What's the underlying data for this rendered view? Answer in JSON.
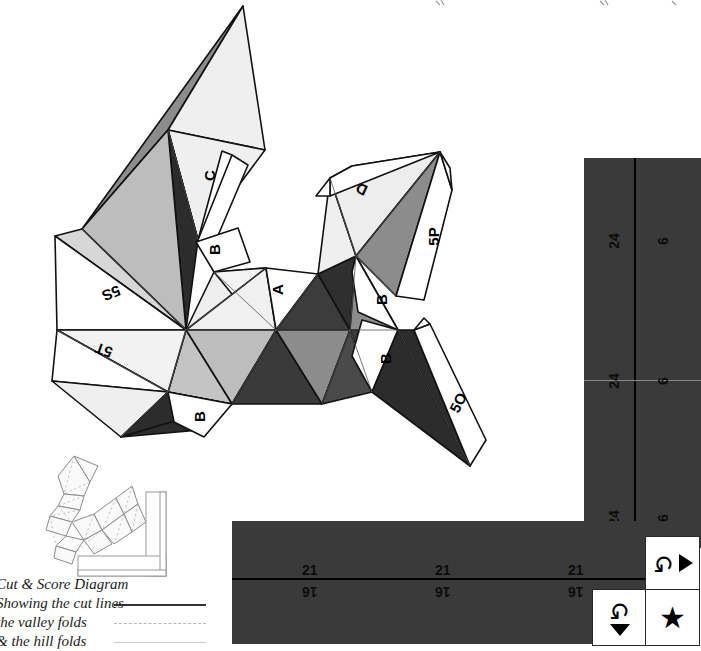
{
  "document": {
    "type": "papercraft-cut-and-score-diagram",
    "title_cut_off_at_top": true
  },
  "legend": {
    "lines": [
      {
        "text": "Cut & Score Diagram",
        "sample": "none"
      },
      {
        "text": "Showing the cut lines",
        "sample": "solid-dark"
      },
      {
        "text": "the valley folds",
        "sample": "dashed-light"
      },
      {
        "text": "& the hill folds",
        "sample": "solid-light"
      }
    ]
  },
  "net_labels": [
    {
      "id": "label-C",
      "text": "C",
      "x": 204,
      "y": 167,
      "rot": -90
    },
    {
      "id": "label-B1",
      "text": "B",
      "x": 209,
      "y": 241,
      "rot": -90
    },
    {
      "id": "label-A",
      "text": "A",
      "x": 272,
      "y": 281,
      "rot": -90
    },
    {
      "id": "label-5S",
      "text": "5S",
      "x": 108,
      "y": 291,
      "rot": 158
    },
    {
      "id": "label-5T",
      "text": "5T",
      "x": 99,
      "y": 348,
      "rot": 200
    },
    {
      "id": "label-B2",
      "text": "B",
      "x": 194,
      "y": 408,
      "rot": -90
    },
    {
      "id": "label-D",
      "text": "D",
      "x": 356,
      "y": 181,
      "rot": 205
    },
    {
      "id": "label-5P",
      "text": "5P",
      "x": 429,
      "y": 232,
      "rot": -90
    },
    {
      "id": "label-B3",
      "text": "B",
      "x": 376,
      "y": 291,
      "rot": -90
    },
    {
      "id": "label-B4",
      "text": "B",
      "x": 380,
      "y": 350,
      "rot": -90
    },
    {
      "id": "label-5O",
      "text": "5O",
      "x": 452,
      "y": 399,
      "rot": -60
    }
  ],
  "panels": {
    "color": "#3a3a3a",
    "vertical": {
      "name": "vertical-strip-panel",
      "segments": [
        {
          "long_label": "24",
          "short_label": "6"
        },
        {
          "long_label": "24",
          "short_label": "6"
        },
        {
          "long_label": "24",
          "short_label": "6"
        }
      ]
    },
    "horizontal": {
      "name": "horizontal-strip-panel",
      "top_row_labels": [
        "21",
        "21",
        "21"
      ],
      "bottom_row_labels": [
        "16",
        "16",
        "16"
      ]
    }
  },
  "symbol_squares": [
    {
      "id": "square-rotate-right",
      "glyphs": [
        "rotate-ccw-icon",
        "triangle-right-icon"
      ],
      "layout": "row"
    },
    {
      "id": "square-rotate-down",
      "glyphs": [
        "rotate-ccw-icon",
        "triangle-down-icon"
      ],
      "layout": "column"
    },
    {
      "id": "square-star",
      "glyphs": [
        "star-icon"
      ],
      "layout": "row"
    }
  ],
  "thumbnail": {
    "name": "mini-layout-preview",
    "caption": "miniature of the same net and L-shaped strip"
  },
  "colors": {
    "panel_dark": "#3a3a3a",
    "ink": "#111111",
    "face_white": "#ffffff",
    "face_light": "#efefef",
    "face_light2": "#dcdcdc",
    "face_mid": "#bdbdbd",
    "face_mid2": "#a6a6a6",
    "face_gray": "#8c8c8c",
    "face_dark": "#5a5a5a",
    "face_darker": "#3c3c3c",
    "face_darkest": "#2c2c2c"
  }
}
